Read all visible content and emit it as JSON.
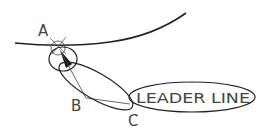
{
  "diagram": {
    "labels": {
      "point_a": "A",
      "point_b": "B",
      "point_c": "C",
      "leader_text": "LEADER LINE"
    },
    "colors": {
      "stroke": "#222222",
      "text": "#444444",
      "background": "#ffffff"
    }
  }
}
